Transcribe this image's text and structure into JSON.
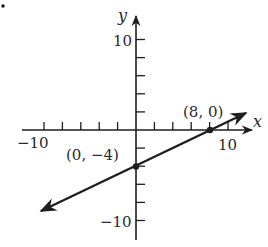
{
  "figure": {
    "marker": "•",
    "axes": {
      "x_label": "x",
      "y_label": "y",
      "x_ticks": {
        "min": -10,
        "max": 10,
        "step": 2
      },
      "y_ticks": {
        "min": -10,
        "max": 10,
        "step": 2
      },
      "x_tick_labels": [
        "−10",
        "10"
      ],
      "y_tick_labels": [
        "10",
        "−10"
      ]
    },
    "points": [
      {
        "label": "(0, −4)",
        "x": 0,
        "y": -4
      },
      {
        "label": "(8, 0)",
        "x": 8,
        "y": 0
      }
    ],
    "line": {
      "slope": 0.5,
      "intercept": -4,
      "equation_hidden": true
    },
    "colors": {
      "ink": "#1e1e1e",
      "background": "#ffffff"
    }
  },
  "labels": {
    "x_axis": "x",
    "y_axis": "y",
    "x_min": "−10",
    "x_max": "10",
    "y_max": "10",
    "y_min": "−10",
    "point_a": "(0, −4)",
    "point_b": "(8, 0)",
    "corner_mark": "•"
  }
}
